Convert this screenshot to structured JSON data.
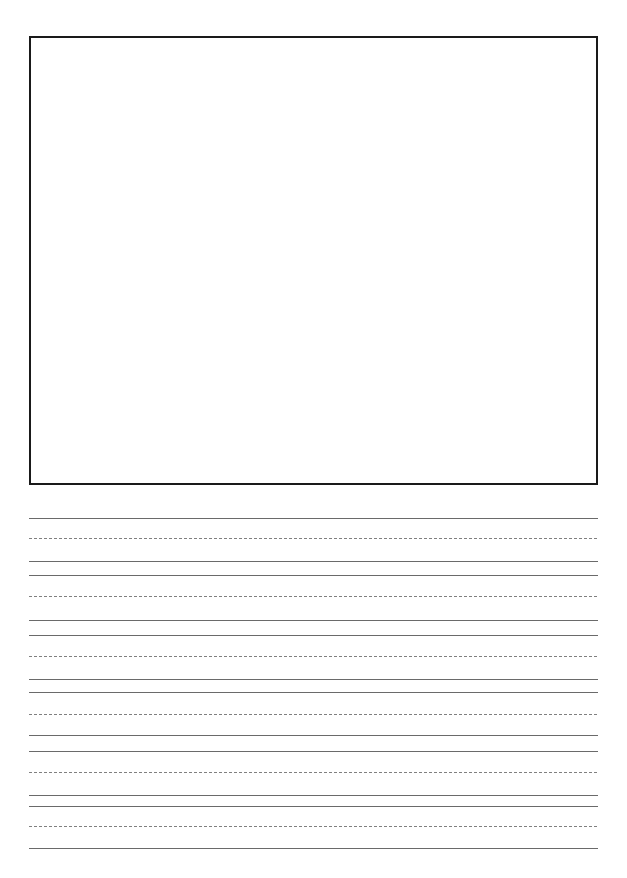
{
  "page": {
    "kind": "primary-handwriting-worksheet",
    "width": 627,
    "height": 878,
    "background_color": "#ffffff",
    "title": "",
    "header_text": "",
    "footer_text": ""
  },
  "drawing_box": {
    "label": "",
    "x": 29,
    "y": 36,
    "width": 569,
    "height": 449,
    "border_color": "#1a1a1a",
    "border_width": 2.5,
    "fill_color": "#ffffff",
    "content_text": ""
  },
  "writing_area": {
    "label": "",
    "left": 29,
    "right": 598,
    "width": 569,
    "solid_color": "#6a6a6a",
    "dashed_color": "#808080",
    "solid_width": 1,
    "dashed_width": 1,
    "dash_pattern": "3px 2px",
    "group_count": 6,
    "lines_per_group": 3,
    "groups": [
      {
        "name": "writing-line-1",
        "top_line_y": 517.5,
        "mid_line_y": 537.5,
        "base_line_y": 560.5,
        "text": ""
      },
      {
        "name": "writing-line-2",
        "top_line_y": 575.0,
        "mid_line_y": 596.0,
        "base_line_y": 620.0,
        "text": ""
      },
      {
        "name": "writing-line-3",
        "top_line_y": 634.5,
        "mid_line_y": 656.0,
        "base_line_y": 679.0,
        "text": ""
      },
      {
        "name": "writing-line-4",
        "top_line_y": 692.0,
        "mid_line_y": 713.5,
        "base_line_y": 734.5,
        "text": ""
      },
      {
        "name": "writing-line-5",
        "top_line_y": 751.0,
        "mid_line_y": 771.5,
        "base_line_y": 794.5,
        "text": ""
      },
      {
        "name": "writing-line-6",
        "top_line_y": 806.0,
        "mid_line_y": 826.0,
        "base_line_y": 847.5,
        "text": ""
      }
    ]
  }
}
